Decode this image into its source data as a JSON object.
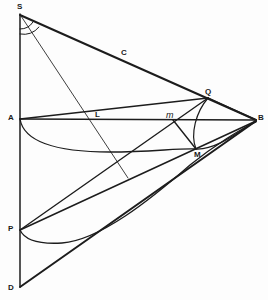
{
  "figure": {
    "background_color": "#fdfdfd",
    "ink_color": "#1c1c1c",
    "width": 268,
    "height": 300
  },
  "labels": {
    "S": "S",
    "C": "C",
    "A": "A",
    "L": "L",
    "m": "m",
    "Q": "Q",
    "B": "B",
    "M": "M",
    "P": "P",
    "D": "D"
  },
  "points": [
    {
      "name": "S",
      "label": "S",
      "x": 20,
      "y": 14,
      "label_x": 17,
      "label_y": 3,
      "style": "bold"
    },
    {
      "name": "C",
      "label": "C",
      "x": 124,
      "y": 59,
      "label_x": 121,
      "label_y": 49,
      "style": "bold"
    },
    {
      "name": "A",
      "label": "A",
      "x": 20,
      "y": 119,
      "label_x": 8,
      "label_y": 114,
      "style": "bold"
    },
    {
      "name": "L",
      "label": "L",
      "x": 99,
      "y": 120,
      "label_x": 95,
      "label_y": 111,
      "style": "bold"
    },
    {
      "name": "m",
      "label": "m",
      "x": 173,
      "y": 120,
      "label_x": 167,
      "label_y": 112,
      "style": "italic"
    },
    {
      "name": "Q",
      "label": "Q",
      "x": 208,
      "y": 99,
      "label_x": 205,
      "label_y": 88,
      "style": "bold"
    },
    {
      "name": "B",
      "label": "B",
      "x": 256,
      "y": 120,
      "label_x": 258,
      "label_y": 114,
      "style": "bold"
    },
    {
      "name": "M",
      "label": "M",
      "x": 196,
      "y": 149,
      "label_x": 194,
      "label_y": 151,
      "style": "bold"
    },
    {
      "name": "P",
      "label": "P",
      "x": 20,
      "y": 230,
      "label_x": 8,
      "label_y": 225,
      "style": "bold"
    },
    {
      "name": "D",
      "label": "D",
      "x": 20,
      "y": 287,
      "label_x": 8,
      "label_y": 284,
      "style": "bold"
    }
  ],
  "segments": [
    {
      "name": "axis-S-D",
      "from": "S",
      "to": "D",
      "weight": "medium"
    },
    {
      "name": "chord-S-C-B",
      "from": "S",
      "to": "B",
      "weight": "heavy"
    },
    {
      "name": "chord-A-C-Q",
      "from": "A",
      "to": "Q",
      "weight": "medium"
    },
    {
      "name": "chord-A-B",
      "from": "A",
      "to": "B",
      "weight": "medium"
    },
    {
      "name": "chord-Q-B",
      "from": "Q",
      "to": "B",
      "weight": "medium"
    },
    {
      "name": "chord-P-B",
      "from": "P",
      "to": "B",
      "weight": "medium"
    },
    {
      "name": "chord-D-B",
      "from": "D",
      "to": "B",
      "weight": "heavy"
    },
    {
      "name": "ray-S-through-L",
      "from": "S",
      "to": "end",
      "weight": "light"
    },
    {
      "name": "ray-P-through-m-Q",
      "from": "P",
      "to": "Q",
      "weight": "medium"
    },
    {
      "name": "chord-m-M",
      "from": "m",
      "to": "M",
      "weight": "medium"
    }
  ],
  "curves": [
    {
      "name": "curve-A-M-B",
      "description": "lower curve from A sagging through M to B"
    },
    {
      "name": "curve-P-to-B",
      "description": "lower curve from P sagging and rising to B"
    },
    {
      "name": "arc-Q-M",
      "description": "arc from Q bowing left down to M"
    },
    {
      "name": "arc-angle-inner-S",
      "description": "small angle arc at S"
    },
    {
      "name": "arc-angle-outer-S",
      "description": "larger angle arc at S"
    }
  ]
}
